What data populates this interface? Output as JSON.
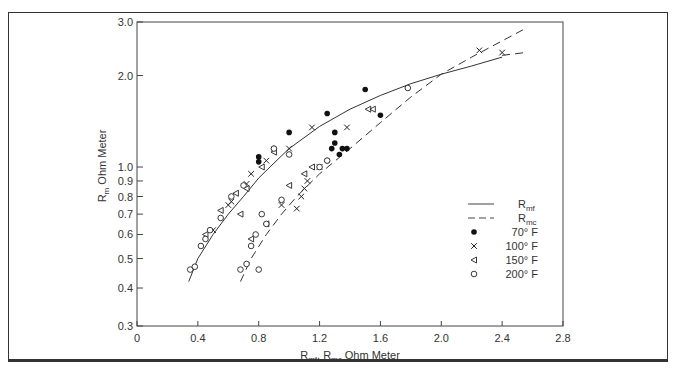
{
  "chart_data": {
    "type": "scatter",
    "title": "",
    "xlabel": "R_mf, R_mc Ohm Meter",
    "ylabel": "R_m Ohm Meter",
    "xlim": [
      0,
      2.8
    ],
    "ylim": [
      0.3,
      3.0
    ],
    "yscale": "log",
    "grid": false,
    "legend_position": "right-middle",
    "x_ticks": [
      "0",
      "0.4",
      "0.8",
      "1.2",
      "1.6",
      "2.0",
      "2.4",
      "2.8"
    ],
    "y_ticks": [
      "0.3",
      "0.4",
      "0.5",
      "0.6",
      "0.7",
      "0.8",
      "0.9",
      "1.0",
      "2.0",
      "3.0"
    ],
    "legend": [
      {
        "label": "R_mf",
        "style": "solid-line"
      },
      {
        "label": "R_mc",
        "style": "dashed-line"
      },
      {
        "label": "70° F",
        "marker": "filled-circle"
      },
      {
        "label": "100° F",
        "marker": "x"
      },
      {
        "label": "150° F",
        "marker": "open-triangle"
      },
      {
        "label": "200° F",
        "marker": "open-circle"
      }
    ],
    "curves": [
      {
        "name": "R_mf",
        "style": "solid",
        "x": [
          0.34,
          0.4,
          0.5,
          0.6,
          0.7,
          0.8,
          0.9,
          1.0,
          1.2,
          1.4,
          1.6,
          1.8,
          2.0,
          2.2,
          2.4
        ],
        "y": [
          0.42,
          0.5,
          0.6,
          0.7,
          0.8,
          0.92,
          1.03,
          1.15,
          1.36,
          1.55,
          1.72,
          1.88,
          2.02,
          2.15,
          2.3
        ]
      },
      {
        "name": "R_mc",
        "style": "dashed",
        "x": [
          0.68,
          0.75,
          0.85,
          0.95,
          1.05,
          1.2,
          1.4,
          1.6,
          1.8,
          2.0,
          2.2,
          2.4,
          2.55
        ],
        "y": [
          0.42,
          0.5,
          0.6,
          0.7,
          0.8,
          0.95,
          1.15,
          1.4,
          1.7,
          2.02,
          2.3,
          2.6,
          2.85
        ]
      },
      {
        "name": "R_mc_extension",
        "style": "dashed",
        "x": [
          2.4,
          2.55
        ],
        "y": [
          2.33,
          2.38
        ]
      }
    ],
    "series": [
      {
        "name": "70° F",
        "marker": "filled-circle",
        "x": [
          0.8,
          0.8,
          0.9,
          1.0,
          1.25,
          1.3,
          1.38,
          1.5,
          1.6,
          1.28,
          1.3,
          1.25,
          1.33,
          1.35
        ],
        "y": [
          1.08,
          1.04,
          1.15,
          1.3,
          1.5,
          1.3,
          1.15,
          1.8,
          1.48,
          1.15,
          1.2,
          1.05,
          1.1,
          1.15
        ]
      },
      {
        "name": "100° F",
        "marker": "x",
        "x": [
          0.5,
          0.6,
          0.75,
          0.85,
          1.0,
          1.15,
          2.25,
          2.4,
          0.95,
          1.05,
          1.08,
          1.1,
          1.12,
          1.2,
          1.38,
          0.72,
          0.62
        ],
        "y": [
          0.62,
          0.75,
          0.95,
          1.05,
          1.15,
          1.35,
          2.42,
          2.38,
          0.75,
          0.73,
          0.8,
          0.85,
          0.9,
          1.0,
          1.35,
          0.88,
          0.77
        ]
      },
      {
        "name": "150° F",
        "marker": "open-triangle",
        "x": [
          0.45,
          0.55,
          0.65,
          0.72,
          0.82,
          0.9,
          0.75,
          0.85,
          1.0,
          1.1,
          1.15,
          1.52,
          1.55,
          0.68
        ],
        "y": [
          0.6,
          0.72,
          0.82,
          0.85,
          1.0,
          1.12,
          0.58,
          0.65,
          0.87,
          0.95,
          1.0,
          1.55,
          1.55,
          0.7
        ]
      },
      {
        "name": "200° F",
        "marker": "open-circle",
        "x": [
          0.35,
          0.38,
          0.42,
          0.45,
          0.48,
          0.55,
          0.62,
          0.7,
          0.9,
          1.0,
          0.68,
          0.72,
          0.75,
          0.78,
          0.8,
          0.85,
          1.2,
          1.25,
          1.78,
          0.82,
          0.95
        ],
        "y": [
          0.46,
          0.47,
          0.55,
          0.58,
          0.62,
          0.68,
          0.8,
          0.87,
          1.15,
          1.1,
          0.46,
          0.48,
          0.55,
          0.6,
          0.46,
          0.65,
          1.0,
          1.05,
          1.82,
          0.7,
          0.78
        ]
      }
    ]
  },
  "labels": {
    "ylabel_main": "R",
    "ylabel_sub": "m",
    "ylabel_rest": " Ohm Meter",
    "xlabel_a": "R",
    "xlabel_a_sub": "mf",
    "xlabel_sep": ", R",
    "xlabel_b_sub": "mc",
    "xlabel_rest": " Ohm Meter"
  }
}
